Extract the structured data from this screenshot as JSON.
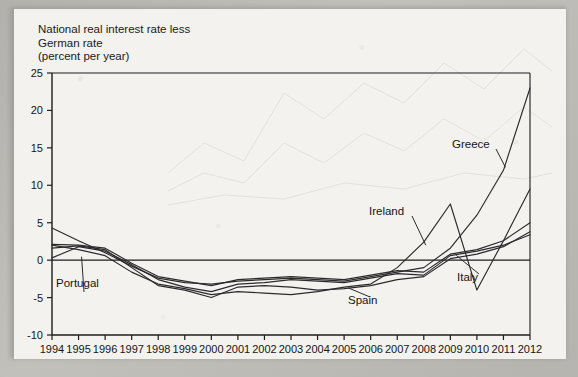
{
  "figure": {
    "axis_title_lines": "National real interest rate less\nGerman rate\n(percent per year)",
    "axis_title_line1": "National real interest rate less",
    "axis_title_line2": "German rate",
    "axis_title_line3": "(percent per year)"
  },
  "labels": {
    "portugal": "Portugal",
    "spain": "Spain",
    "italy": "Italy",
    "ireland": "Ireland",
    "greece": "Greece"
  },
  "colors": {
    "line": "#2b2b2b",
    "axis": "#1d1d1d",
    "page": "#f3f2ef",
    "border": "#b6b4af"
  },
  "chart_data": {
    "type": "line",
    "xlabel": "",
    "ylabel": "National real interest rate less German rate (percent per year)",
    "ylim": [
      -10,
      25
    ],
    "yticks": [
      -10,
      -5,
      0,
      5,
      10,
      15,
      20,
      25
    ],
    "ytick_labels": [
      "-10",
      "-5",
      "0",
      "5",
      "10",
      "15",
      "20",
      "25"
    ],
    "grid": false,
    "legend": "inline-annotations",
    "x": [
      1994,
      1995,
      1996,
      1997,
      1998,
      1999,
      2000,
      2001,
      2002,
      2003,
      2004,
      2005,
      2006,
      2007,
      2008,
      2009,
      2010,
      2011,
      2012
    ],
    "xtick_labels": [
      "1994",
      "1995",
      "1996",
      "1997",
      "1998",
      "1999",
      "2000",
      "2001",
      "2002",
      "2003",
      "2004",
      "2005",
      "2006",
      "2007",
      "2008",
      "2009",
      "2010",
      "2011",
      "2012"
    ],
    "series": [
      {
        "name": "Portugal",
        "values": [
          0.3,
          1.8,
          1.2,
          -0.6,
          -2.6,
          -3.6,
          -4.2,
          -3.2,
          -3.0,
          -2.6,
          -2.8,
          -3.0,
          -2.4,
          -1.8,
          -2.0,
          0.6,
          1.2,
          2.0,
          3.4
        ]
      },
      {
        "name": "Spain",
        "values": [
          1.6,
          1.9,
          1.4,
          -1.0,
          -3.4,
          -4.0,
          -5.0,
          -3.6,
          -3.4,
          -3.6,
          -4.0,
          -3.8,
          -3.4,
          -2.6,
          -2.2,
          0.2,
          0.8,
          1.8,
          3.8
        ]
      },
      {
        "name": "Italy",
        "values": [
          2.1,
          2.0,
          1.6,
          -0.4,
          -2.2,
          -2.8,
          -3.4,
          -2.6,
          -2.4,
          -2.2,
          -2.4,
          -2.6,
          -2.0,
          -1.4,
          -1.6,
          0.8,
          1.4,
          2.6,
          5.0
        ]
      },
      {
        "name": "Ireland",
        "values": [
          2.0,
          1.4,
          0.6,
          -1.6,
          -3.2,
          -3.8,
          -4.6,
          -4.2,
          -4.4,
          -4.6,
          -4.2,
          -3.6,
          -3.2,
          -1.0,
          2.4,
          7.5,
          -4.0,
          2.6,
          9.5
        ]
      },
      {
        "name": "Greece",
        "values": [
          4.3,
          2.6,
          1.0,
          -0.8,
          -2.4,
          -3.0,
          -3.2,
          -2.8,
          -2.6,
          -2.4,
          -2.6,
          -2.8,
          -2.2,
          -1.6,
          -1.0,
          1.6,
          6.0,
          12.0,
          23.0
        ]
      }
    ],
    "annotations": [
      {
        "text": "Portugal",
        "points_to_series": "Portugal",
        "at_year": 1995
      },
      {
        "text": "Spain",
        "points_to_series": "Spain",
        "at_year": 2005
      },
      {
        "text": "Italy",
        "points_to_series": "Italy",
        "at_year": 2009
      },
      {
        "text": "Ireland",
        "points_to_series": "Ireland",
        "at_year": 2008
      },
      {
        "text": "Greece",
        "points_to_series": "Greece",
        "at_year": 2011
      }
    ]
  }
}
